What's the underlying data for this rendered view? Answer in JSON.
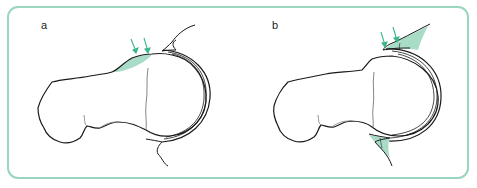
{
  "figure": {
    "panels": [
      {
        "label": "a",
        "description": "Femoral head-neck junction with bony prominence (shaded) at the anterolateral head-neck junction; arrows indicate impingement site",
        "arrow_count": 2,
        "highlight": "cam-lesion"
      },
      {
        "label": "b",
        "description": "Normal femoral head with excessive acetabular coverage; shaded acetabular rim overhang at top and bottom; arrows indicate impingement site",
        "arrow_count": 2,
        "highlight": "pincer-lesion"
      }
    ],
    "colors": {
      "border": "#9ad6bd",
      "highlight_fill": "#a9dcc6",
      "arrow": "#3bb58a",
      "line": "#1a1a1a",
      "thin_line": "#555555"
    }
  }
}
